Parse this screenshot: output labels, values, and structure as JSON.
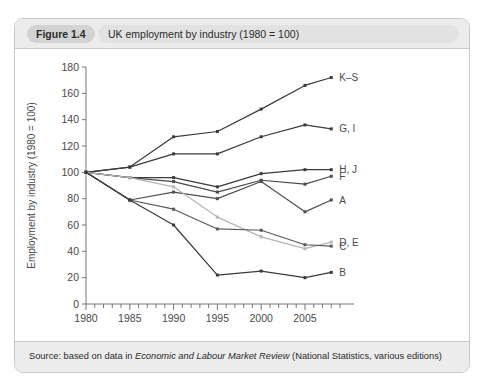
{
  "figure": {
    "number": "Figure 1.4",
    "caption": "UK employment by industry (1980 = 100)",
    "source_prefix": "Source: based on data in ",
    "source_italic": "Economic and Labour Market Review",
    "source_suffix": " (National Statistics, various editions)"
  },
  "chart_data": {
    "type": "line",
    "title": "UK employment by industry (1980 = 100)",
    "xlabel": "",
    "ylabel": "Employment by industry (1980 = 100)",
    "x": [
      1980,
      1985,
      1990,
      1995,
      2000,
      2005,
      2008
    ],
    "xlim": [
      1980,
      2009
    ],
    "ylim": [
      0,
      180
    ],
    "yticks": [
      0,
      20,
      40,
      60,
      80,
      100,
      120,
      140,
      160,
      180
    ],
    "xticks": [
      1980,
      1985,
      1990,
      1995,
      2000,
      2005
    ],
    "xtick_labels": [
      "1980",
      "1985",
      "1990",
      "1995",
      "2000",
      "2005"
    ],
    "ytick_labels": [
      "0",
      "20",
      "40",
      "60",
      "80",
      "100",
      "120",
      "140",
      "160",
      "180"
    ],
    "x_minor_tick_every": 1,
    "grid": false,
    "legend": "right-of-axes-series-labels",
    "markers": true,
    "series": [
      {
        "name": "K–S",
        "label": "K–S",
        "color": "#3a3a3a",
        "values": [
          100,
          104,
          127,
          131,
          148,
          166,
          172
        ]
      },
      {
        "name": "G, I",
        "label": "G, I",
        "color": "#3a3a3a",
        "values": [
          100,
          104,
          114,
          114,
          127,
          136,
          133
        ]
      },
      {
        "name": "H, J",
        "label": "H, J",
        "color": "#3a3a3a",
        "values": [
          100,
          96,
          96,
          89,
          99,
          102,
          102
        ]
      },
      {
        "name": "F",
        "label": "F",
        "color": "#4a4a4a",
        "values": [
          100,
          96,
          93,
          85,
          94,
          91,
          97
        ]
      },
      {
        "name": "A",
        "label": "A",
        "color": "#4f4f4f",
        "values": [
          100,
          79,
          85,
          80,
          93,
          70,
          79
        ]
      },
      {
        "name": "D, E",
        "label": "D, E",
        "color": "#b5b5b5",
        "values": [
          100,
          96,
          89,
          66,
          51,
          42,
          47
        ]
      },
      {
        "name": "C",
        "label": "C",
        "color": "#5a5a5a",
        "values": [
          100,
          79,
          72,
          57,
          56,
          45,
          44
        ]
      },
      {
        "name": "B",
        "label": "B",
        "color": "#3a3a3a",
        "values": [
          100,
          79,
          60,
          22,
          25,
          20,
          24
        ]
      }
    ]
  }
}
